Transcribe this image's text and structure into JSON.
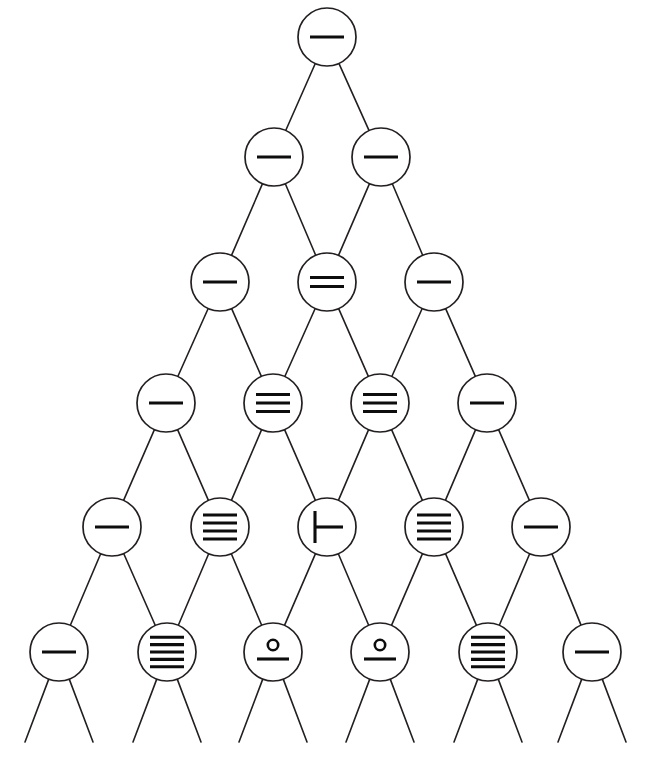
{
  "diagram": {
    "canvas": {
      "width": 652,
      "height": 760,
      "background": "#ffffff"
    },
    "style": {
      "edge_color": "#231f20",
      "node_stroke_color": "#231f20",
      "node_fill_color": "#ffffff",
      "glyph_color": "#0d0d0d",
      "edge_width": 1.6,
      "node_stroke_width": 1.7,
      "node_radius": 29
    },
    "rows": [
      {
        "index": 0,
        "y": 37,
        "nodes": [
          {
            "id": "n0-0",
            "x": 327,
            "glyph": "lines",
            "lines": 1,
            "label": "one-line"
          }
        ]
      },
      {
        "index": 1,
        "y": 157,
        "nodes": [
          {
            "id": "n1-0",
            "x": 274,
            "glyph": "lines",
            "lines": 1,
            "label": "one-line"
          },
          {
            "id": "n1-1",
            "x": 381,
            "glyph": "lines",
            "lines": 1,
            "label": "one-line"
          }
        ]
      },
      {
        "index": 2,
        "y": 282,
        "nodes": [
          {
            "id": "n2-0",
            "x": 220,
            "glyph": "lines",
            "lines": 1,
            "label": "one-line"
          },
          {
            "id": "n2-1",
            "x": 327,
            "glyph": "lines",
            "lines": 2,
            "label": "two-lines"
          },
          {
            "id": "n2-2",
            "x": 434,
            "glyph": "lines",
            "lines": 1,
            "label": "one-line"
          }
        ]
      },
      {
        "index": 3,
        "y": 403,
        "nodes": [
          {
            "id": "n3-0",
            "x": 166,
            "glyph": "lines",
            "lines": 1,
            "label": "one-line"
          },
          {
            "id": "n3-1",
            "x": 273,
            "glyph": "lines",
            "lines": 3,
            "label": "three-lines"
          },
          {
            "id": "n3-2",
            "x": 380,
            "glyph": "lines",
            "lines": 3,
            "label": "three-lines"
          },
          {
            "id": "n3-3",
            "x": 487,
            "glyph": "lines",
            "lines": 1,
            "label": "one-line"
          }
        ]
      },
      {
        "index": 4,
        "y": 527,
        "nodes": [
          {
            "id": "n4-0",
            "x": 112,
            "glyph": "lines",
            "lines": 1,
            "label": "one-line"
          },
          {
            "id": "n4-1",
            "x": 220,
            "glyph": "lines",
            "lines": 4,
            "label": "four-lines"
          },
          {
            "id": "n4-2",
            "x": 327,
            "glyph": "turnstile",
            "lines": 0,
            "label": "turnstile"
          },
          {
            "id": "n4-3",
            "x": 434,
            "glyph": "lines",
            "lines": 4,
            "label": "four-lines"
          },
          {
            "id": "n4-4",
            "x": 541,
            "glyph": "lines",
            "lines": 1,
            "label": "one-line"
          }
        ]
      },
      {
        "index": 5,
        "y": 652,
        "nodes": [
          {
            "id": "n5-0",
            "x": 59,
            "glyph": "lines",
            "lines": 1,
            "label": "one-line"
          },
          {
            "id": "n5-1",
            "x": 167,
            "glyph": "lines",
            "lines": 5,
            "label": "five-lines"
          },
          {
            "id": "n5-2",
            "x": 273,
            "glyph": "ring-over-line",
            "lines": 0,
            "label": "ring-over-line"
          },
          {
            "id": "n5-3",
            "x": 380,
            "glyph": "ring-over-line",
            "lines": 0,
            "label": "ring-over-line"
          },
          {
            "id": "n5-4",
            "x": 488,
            "glyph": "lines",
            "lines": 5,
            "label": "five-lines"
          },
          {
            "id": "n5-5",
            "x": 592,
            "glyph": "lines",
            "lines": 1,
            "label": "one-line"
          }
        ]
      }
    ],
    "dangling_edges": {
      "from_row": 5,
      "y_end": 742,
      "x_spread": 34,
      "description": "each bottom node emits two unterminated descending edges"
    }
  }
}
